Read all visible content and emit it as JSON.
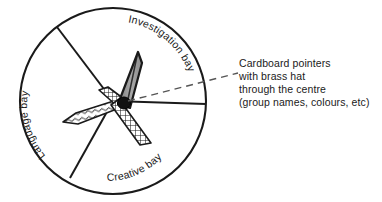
{
  "figure": {
    "circle": {
      "center_x": 113,
      "center_y": 101,
      "radius": 93,
      "stroke": "#1a1a1a"
    },
    "sectors": [
      {
        "name": "investigation-bay",
        "label": "Investigation bay"
      },
      {
        "name": "language-bay",
        "label": "Language bay"
      },
      {
        "name": "creative-bay",
        "label": "Creative bay"
      }
    ],
    "dividers": [
      {
        "name": "divider-upper-left",
        "angle_deg": 203
      },
      {
        "name": "divider-lower-left",
        "angle_deg": 118
      },
      {
        "name": "divider-right",
        "angle_deg": 2
      }
    ],
    "pointers": [
      {
        "name": "pointer-grey",
        "texture": "solid-grey",
        "fill": "#9a9a9a",
        "direction": "up-right"
      },
      {
        "name": "pointer-wavy",
        "texture": "wavy-hatch",
        "fill": "#ffffff",
        "direction": "left"
      },
      {
        "name": "pointer-crosshatch",
        "texture": "cross-hatch",
        "fill": "#ffffff",
        "direction": "down-right"
      },
      {
        "name": "pointer-checker-stub",
        "texture": "checker",
        "fill": "#ffffff",
        "direction": "up-left"
      }
    ],
    "brass_hat": {
      "name": "brass-hat",
      "fill": "#111111"
    },
    "leader_line": {
      "name": "leader-line",
      "style": "dashed",
      "stroke": "#4a4a4a"
    }
  },
  "annotation": {
    "line1": "Cardboard pointers",
    "line2": "with brass hat",
    "line3": "through the centre",
    "line4": "(group names, colours, etc)"
  }
}
